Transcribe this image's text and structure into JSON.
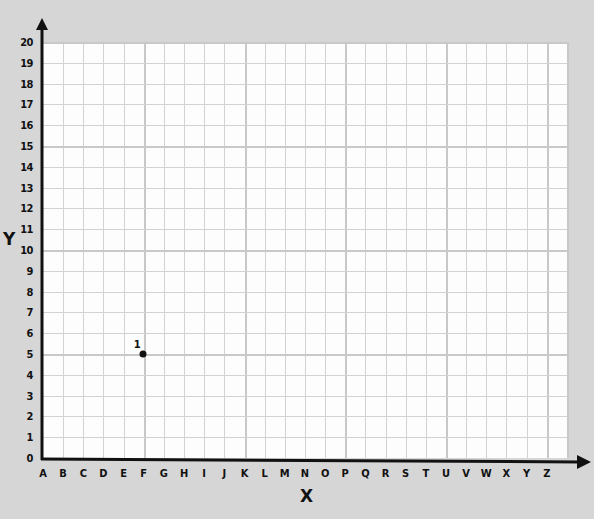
{
  "chart_data": {
    "type": "scatter",
    "title": "",
    "xlabel": "X",
    "ylabel": "Y",
    "x_categories": [
      "A",
      "B",
      "C",
      "D",
      "E",
      "F",
      "G",
      "H",
      "I",
      "J",
      "K",
      "L",
      "M",
      "N",
      "O",
      "P",
      "Q",
      "R",
      "S",
      "T",
      "U",
      "V",
      "W",
      "X",
      "Y",
      "Z"
    ],
    "y_ticks": [
      0,
      1,
      2,
      3,
      4,
      5,
      6,
      7,
      8,
      9,
      10,
      11,
      12,
      13,
      14,
      15,
      16,
      17,
      18,
      19,
      20
    ],
    "ylim": [
      0,
      20
    ],
    "grid": true,
    "points": [
      {
        "label": "1",
        "x": "F",
        "y": 5
      }
    ]
  },
  "colors": {
    "background": "#d6d6d6",
    "grid_fill": "#fdfdfd",
    "grid_line": "#d2d2d2",
    "axis": "#111111",
    "point": "#111111"
  }
}
